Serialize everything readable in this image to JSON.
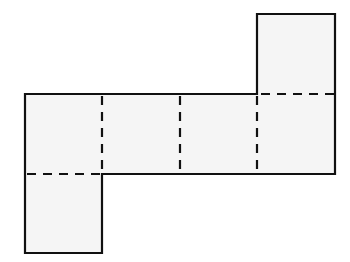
{
  "diagram": {
    "type": "cube-net",
    "face_count": 6,
    "colors": {
      "face_fill": "#f5f5f5",
      "stroke": "#111111",
      "background": "#ffffff"
    },
    "faces": [
      {
        "id": "top-right",
        "x": 257,
        "y": 14,
        "w": 78,
        "h": 80
      },
      {
        "id": "row-1",
        "x": 25,
        "y": 94,
        "w": 77,
        "h": 80
      },
      {
        "id": "row-2",
        "x": 102,
        "y": 94,
        "w": 78,
        "h": 80
      },
      {
        "id": "row-3",
        "x": 180,
        "y": 94,
        "w": 77,
        "h": 80
      },
      {
        "id": "row-4",
        "x": 257,
        "y": 94,
        "w": 78,
        "h": 80
      },
      {
        "id": "bottom-left",
        "x": 25,
        "y": 174,
        "w": 77,
        "h": 79
      }
    ],
    "fold_lines": [
      {
        "x1": 257,
        "y1": 94,
        "x2": 335,
        "y2": 94
      },
      {
        "x1": 102,
        "y1": 94,
        "x2": 102,
        "y2": 174
      },
      {
        "x1": 180,
        "y1": 94,
        "x2": 180,
        "y2": 174
      },
      {
        "x1": 257,
        "y1": 94,
        "x2": 257,
        "y2": 174
      },
      {
        "x1": 25,
        "y1": 174,
        "x2": 102,
        "y2": 174
      }
    ]
  }
}
